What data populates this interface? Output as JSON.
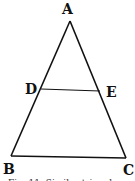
{
  "diagram": {
    "type": "triangle-with-parallel-segment",
    "stroke_color": "#111111",
    "background": "#ffffff",
    "vertices": {
      "A": {
        "label": "A",
        "x": 70,
        "y": 21,
        "label_x": 62,
        "label_y": 14
      },
      "B": {
        "label": "B",
        "x": 11,
        "y": 156,
        "label_x": 3,
        "label_y": 174
      },
      "C": {
        "label": "C",
        "x": 126,
        "y": 158,
        "label_x": 123,
        "label_y": 175
      },
      "D": {
        "label": "D",
        "x": 41,
        "y": 89,
        "label_x": 25,
        "label_y": 94
      },
      "E": {
        "label": "E",
        "x": 100,
        "y": 91,
        "label_x": 106,
        "label_y": 97
      }
    },
    "segments": [
      {
        "from": "A",
        "to": "B"
      },
      {
        "from": "A",
        "to": "C"
      },
      {
        "from": "B",
        "to": "C"
      },
      {
        "from": "D",
        "to": "E"
      }
    ],
    "caption": "Fig. 11.  Similar triangles"
  }
}
